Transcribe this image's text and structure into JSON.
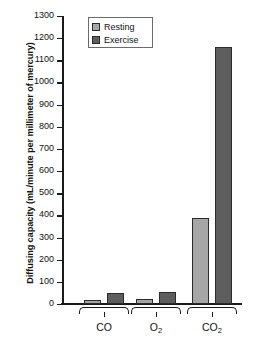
{
  "chart_data": {
    "type": "bar",
    "title": "",
    "subtitle": "",
    "xlabel": "",
    "ylabel": "Diffusing capacity (mL/minute per millimeter of mercury)",
    "categories": [
      "CO",
      "O2",
      "CO2"
    ],
    "category_labels_html": [
      "CO",
      "O<sub>2</sub>",
      "CO<sub>2</sub>"
    ],
    "series": [
      {
        "name": "Resting",
        "color": "#a6a6a6",
        "values": [
          20,
          21,
          390
        ]
      },
      {
        "name": "Exercise",
        "color": "#5e5e5e",
        "values": [
          50,
          55,
          1160
        ]
      }
    ],
    "ylim": [
      0,
      1300
    ],
    "ytick_step": 100,
    "yticks": [
      0,
      100,
      200,
      300,
      400,
      500,
      600,
      700,
      800,
      900,
      1000,
      1100,
      1200,
      1300
    ],
    "ytick_labels": [
      "0",
      "100",
      "200",
      "300",
      "400",
      "500",
      "600",
      "700",
      "800",
      "900",
      "1000",
      "1100",
      "1200",
      "1300"
    ],
    "grid": false,
    "legend_position": "top-left-inside",
    "legend_entries": [
      "Resting",
      "Exercise"
    ]
  },
  "legend": {
    "items": [
      {
        "label": "Resting",
        "swatch": "legend-swatch-resting"
      },
      {
        "label": "Exercise",
        "swatch": "legend-swatch-exercise"
      }
    ]
  },
  "axis": {
    "y_title": "Diffusing capacity (mL/minute per millimeter of mercury)"
  }
}
